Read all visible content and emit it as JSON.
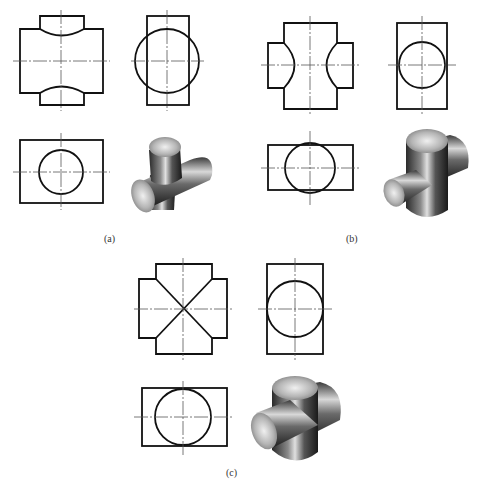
{
  "figure": {
    "panels": [
      {
        "id": "a",
        "caption": "(a)",
        "case": "vertical cylinder smaller than horizontal cylinder"
      },
      {
        "id": "b",
        "caption": "(b)",
        "case": "vertical cylinder larger than horizontal cylinder"
      },
      {
        "id": "c",
        "caption": "(c)",
        "case": "cylinders of equal diameter - intersection lines are straight diagonals"
      }
    ]
  },
  "colors": {
    "outline": "#111111",
    "centerline": "#555555",
    "background": "#ffffff",
    "metal_light": "#e8e8e8",
    "metal_dark": "#2a2a2a"
  }
}
